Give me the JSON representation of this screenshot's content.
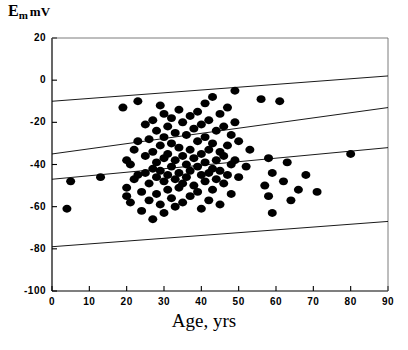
{
  "chart_data": {
    "type": "scatter",
    "title": "",
    "ylabel": "E_m mV",
    "ylabel_main": "E",
    "ylabel_sub": "m",
    "ylabel_unit": "mV",
    "xlabel": "Age, yrs",
    "xlim": [
      0,
      90
    ],
    "ylim": [
      -100,
      20
    ],
    "xticks": [
      0,
      10,
      20,
      30,
      40,
      50,
      60,
      70,
      80,
      90
    ],
    "yticks": [
      20,
      0,
      -20,
      -40,
      -60,
      -80,
      -100
    ],
    "grid": false,
    "legend": false,
    "marker": "filled-circle",
    "marker_color": "#000000",
    "marker_size_px": 9,
    "line_color": "#000000",
    "points": [
      [
        4,
        -61
      ],
      [
        5,
        -48
      ],
      [
        13,
        -46
      ],
      [
        19,
        -13
      ],
      [
        20,
        -38
      ],
      [
        20,
        -51
      ],
      [
        20,
        -55
      ],
      [
        21,
        -40
      ],
      [
        21,
        -58
      ],
      [
        22,
        -33
      ],
      [
        22,
        -47
      ],
      [
        23,
        -10
      ],
      [
        23,
        -29
      ],
      [
        23,
        -45
      ],
      [
        24,
        -53
      ],
      [
        24,
        -62
      ],
      [
        25,
        -21
      ],
      [
        25,
        -36
      ],
      [
        25,
        -44
      ],
      [
        26,
        -28
      ],
      [
        26,
        -49
      ],
      [
        26,
        -57
      ],
      [
        27,
        -19
      ],
      [
        27,
        -34
      ],
      [
        27,
        -42
      ],
      [
        27,
        -66
      ],
      [
        28,
        -24
      ],
      [
        28,
        -39
      ],
      [
        28,
        -46
      ],
      [
        28,
        -54
      ],
      [
        29,
        -12
      ],
      [
        29,
        -31
      ],
      [
        29,
        -43
      ],
      [
        29,
        -59
      ],
      [
        30,
        -16
      ],
      [
        30,
        -27
      ],
      [
        30,
        -37
      ],
      [
        30,
        -48
      ],
      [
        30,
        -63
      ],
      [
        31,
        -22
      ],
      [
        31,
        -35
      ],
      [
        31,
        -45
      ],
      [
        31,
        -52
      ],
      [
        32,
        -18
      ],
      [
        32,
        -30
      ],
      [
        32,
        -41
      ],
      [
        32,
        -56
      ],
      [
        33,
        -25
      ],
      [
        33,
        -38
      ],
      [
        33,
        -47
      ],
      [
        33,
        -60
      ],
      [
        34,
        -14
      ],
      [
        34,
        -32
      ],
      [
        34,
        -44
      ],
      [
        34,
        -51
      ],
      [
        35,
        -20
      ],
      [
        35,
        -36
      ],
      [
        35,
        -49
      ],
      [
        35,
        -58
      ],
      [
        36,
        -26
      ],
      [
        36,
        -40
      ],
      [
        36,
        -46
      ],
      [
        37,
        -17
      ],
      [
        37,
        -33
      ],
      [
        37,
        -43
      ],
      [
        37,
        -55
      ],
      [
        38,
        -23
      ],
      [
        38,
        -37
      ],
      [
        38,
        -50
      ],
      [
        39,
        -15
      ],
      [
        39,
        -29
      ],
      [
        39,
        -41
      ],
      [
        39,
        -53
      ],
      [
        40,
        -21
      ],
      [
        40,
        -35
      ],
      [
        40,
        -45
      ],
      [
        40,
        -61
      ],
      [
        41,
        -11
      ],
      [
        41,
        -27
      ],
      [
        41,
        -39
      ],
      [
        41,
        -48
      ],
      [
        42,
        -19
      ],
      [
        42,
        -33
      ],
      [
        42,
        -44
      ],
      [
        42,
        -57
      ],
      [
        43,
        -8
      ],
      [
        43,
        -30
      ],
      [
        43,
        -42
      ],
      [
        43,
        -52
      ],
      [
        44,
        -24
      ],
      [
        44,
        -38
      ],
      [
        44,
        -47
      ],
      [
        45,
        -16
      ],
      [
        45,
        -34
      ],
      [
        45,
        -43
      ],
      [
        45,
        -59
      ],
      [
        46,
        -22
      ],
      [
        46,
        -36
      ],
      [
        46,
        -49
      ],
      [
        47,
        -13
      ],
      [
        47,
        -31
      ],
      [
        47,
        -45
      ],
      [
        48,
        -26
      ],
      [
        48,
        -40
      ],
      [
        48,
        -54
      ],
      [
        49,
        -5
      ],
      [
        49,
        -20
      ],
      [
        49,
        -38
      ],
      [
        50,
        -29
      ],
      [
        50,
        -46
      ],
      [
        52,
        -41
      ],
      [
        53,
        -33
      ],
      [
        56,
        -9
      ],
      [
        57,
        -50
      ],
      [
        58,
        -37
      ],
      [
        58,
        -55
      ],
      [
        59,
        -44
      ],
      [
        59,
        -63
      ],
      [
        61,
        -10
      ],
      [
        62,
        -48
      ],
      [
        63,
        -39
      ],
      [
        64,
        -57
      ],
      [
        66,
        -52
      ],
      [
        68,
        -45
      ],
      [
        71,
        -53
      ],
      [
        80,
        -35
      ]
    ],
    "lines": [
      {
        "name": "upper-band",
        "x": [
          0,
          90
        ],
        "y": [
          -10,
          2
        ]
      },
      {
        "name": "upper-inner-band",
        "x": [
          0,
          90
        ],
        "y": [
          -35,
          -13
        ]
      },
      {
        "name": "regression-line",
        "x": [
          0,
          90
        ],
        "y": [
          -47,
          -32
        ]
      },
      {
        "name": "lower-band",
        "x": [
          0,
          90
        ],
        "y": [
          -79,
          -67
        ]
      }
    ]
  },
  "axes": {
    "x_title": "Age, yrs",
    "y_title_main": "E",
    "y_title_sub": "m",
    "y_title_unit": "mV"
  }
}
